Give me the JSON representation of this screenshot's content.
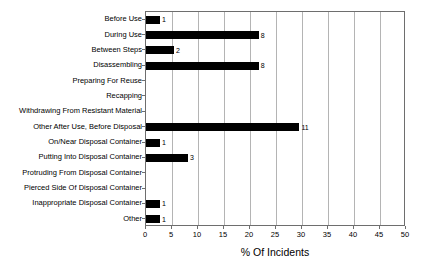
{
  "chart_data": {
    "type": "bar",
    "orientation": "horizontal",
    "title": "",
    "xlabel": "% Of Incidents",
    "ylabel": "",
    "xlim": [
      0,
      50
    ],
    "xticks": [
      0,
      5,
      10,
      15,
      20,
      25,
      30,
      35,
      40,
      45,
      50
    ],
    "grid": "vertical",
    "legend": "none",
    "bar_color": "#000000",
    "categories": [
      "Before Use",
      "During Use",
      "Between Steps",
      "Disassembling",
      "Preparing For Reuse",
      "Recapping",
      "Withdrawing From Resistant Material",
      "Other After Use, Before Disposal",
      "On/Near Disposal Container",
      "Putting Into Disposal Container",
      "Protruding From Disposal Container",
      "Pierced Side Of Disposal Container",
      "Inappropriate Disposal Container",
      "Other"
    ],
    "values": [
      2.7,
      21.7,
      5.4,
      21.7,
      0,
      0,
      0,
      29.5,
      2.7,
      8.1,
      0,
      0,
      2.7,
      2.7
    ],
    "data_labels": [
      "1",
      "8",
      "2",
      "8",
      "",
      "",
      "",
      "11",
      "1",
      "3",
      "",
      "",
      "1",
      "1"
    ]
  }
}
